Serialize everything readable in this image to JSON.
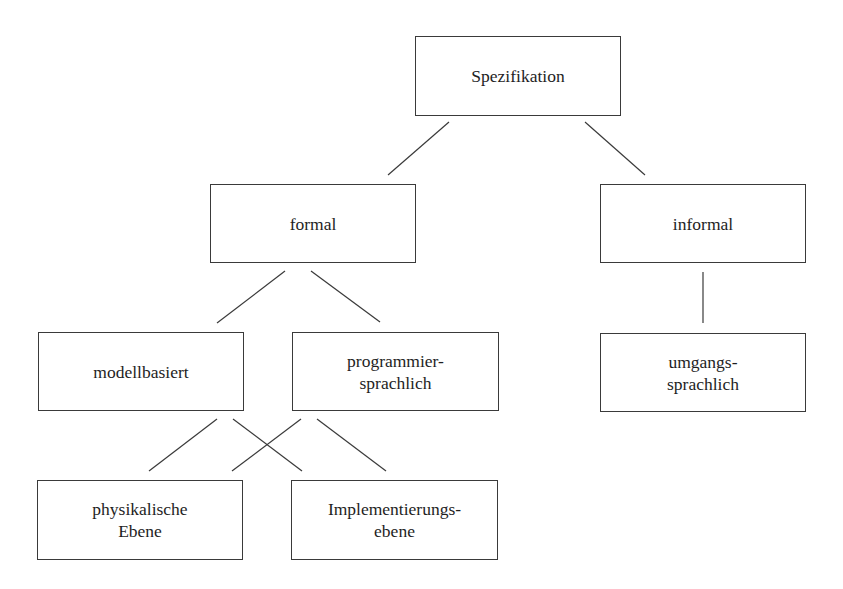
{
  "diagram": {
    "type": "tree",
    "nodes": {
      "root": {
        "lines": [
          "Spezifikation"
        ]
      },
      "formal": {
        "lines": [
          "formal"
        ]
      },
      "informal": {
        "lines": [
          "informal"
        ]
      },
      "modell": {
        "lines": [
          "modellbasiert"
        ]
      },
      "programm": {
        "lines": [
          "programmier-",
          "sprachlich"
        ]
      },
      "umgang": {
        "lines": [
          "umgangs-",
          "sprachlich"
        ]
      },
      "physik": {
        "lines": [
          "physikalische",
          "Ebene"
        ]
      },
      "implement": {
        "lines": [
          "Implementierungs-",
          "ebene"
        ]
      }
    },
    "edges": [
      {
        "from": "Spezifikation",
        "to": "formal"
      },
      {
        "from": "Spezifikation",
        "to": "informal"
      },
      {
        "from": "formal",
        "to": "modellbasiert"
      },
      {
        "from": "formal",
        "to": "programmiersprachlich"
      },
      {
        "from": "informal",
        "to": "umgangssprachlich"
      },
      {
        "from": "modellbasiert",
        "to": "physikalische Ebene"
      },
      {
        "from": "modellbasiert",
        "to": "Implementierungsebene"
      },
      {
        "from": "programmiersprachlich",
        "to": "physikalische Ebene"
      },
      {
        "from": "programmiersprachlich",
        "to": "Implementierungsebene"
      }
    ],
    "colors": {
      "stroke": "#3a3a3a",
      "text": "#1e1e1e",
      "background": "#ffffff"
    }
  }
}
